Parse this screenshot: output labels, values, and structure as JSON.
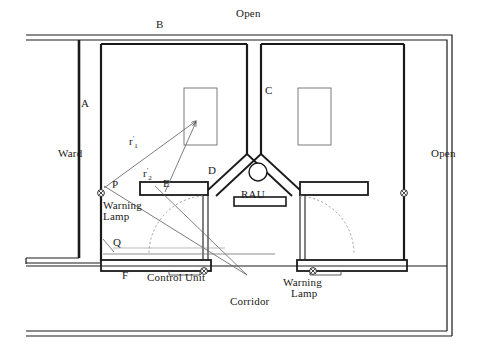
{
  "figure": {
    "type": "architectural-floor-plan"
  },
  "labels": {
    "open_top": "Open",
    "open_right": "Open",
    "zone_a": "A",
    "zone_b": "B",
    "zone_c": "C",
    "zone_d": "D",
    "zone_e": "E",
    "zone_f": "F",
    "ward": "Ward",
    "corridor": "Corridor",
    "rau": "RAU",
    "point_p": "P",
    "point_q": "Q",
    "r1_base": "r",
    "r1_sub": "1",
    "r1_prime": "'",
    "r2_base": "r",
    "r2_sub": "2",
    "r2_prime": "'",
    "control_unit": "Control Unit",
    "warning_lamp_left_line1": "Warning",
    "warning_lamp_left_line2": "Lamp",
    "warning_lamp_right_line1": "Warning",
    "warning_lamp_right_line2": "Lamp"
  },
  "icons": {
    "warning_lamp_symbol": "crossed-circle-icon",
    "rau_symbol": "circle-icon",
    "door_swing_symbol": "dashed-arc-icon"
  },
  "colors": {
    "wall_stroke": "#1a1a1a",
    "thin_stroke": "#4a4a4a",
    "ray_stroke": "#555555",
    "dashed_stroke": "#8a8a8a",
    "background": "#ffffff"
  },
  "geometry": {
    "canvas": {
      "width": 480,
      "height": 349
    },
    "outer_wall_top_y": 35,
    "outer_wall_right_x": 452,
    "corridor_bottom_y": 336,
    "rau_center": {
      "x": 258,
      "y": 172
    },
    "rau_radius": 9,
    "source_point": {
      "x": 198,
      "y": 120
    },
    "p_point": {
      "x": 104,
      "y": 185
    },
    "q_point": {
      "x": 104,
      "y": 248
    }
  }
}
